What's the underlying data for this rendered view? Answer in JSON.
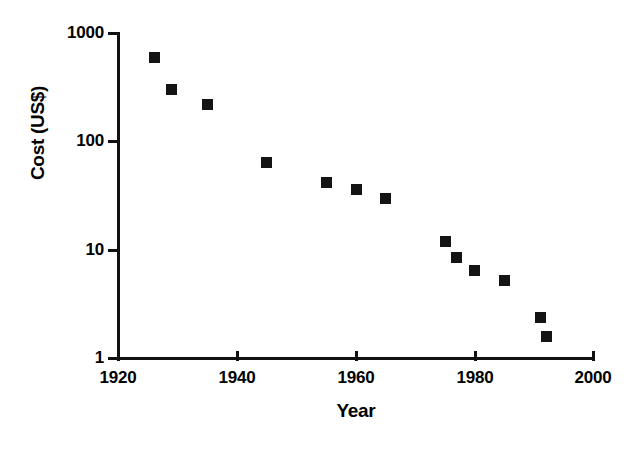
{
  "chart_data": {
    "type": "scatter",
    "title": "",
    "xlabel": "Year",
    "ylabel": "Cost (US$)",
    "xlim": [
      1920,
      2000
    ],
    "ylim": [
      1,
      1000
    ],
    "yscale": "log",
    "xscale": "linear",
    "grid": false,
    "legend": null,
    "xticks": [
      1920,
      1940,
      1960,
      1980,
      2000
    ],
    "xtick_labels": [
      "1920",
      "1940",
      "1960",
      "1980",
      "2000"
    ],
    "yticks": [
      1,
      10,
      100,
      1000
    ],
    "ytick_labels": [
      "1",
      "10",
      "100",
      "1000"
    ],
    "marker": "square",
    "marker_color": "#141414",
    "series": [
      {
        "name": "Cost",
        "x": [
          1926,
          1929,
          1935,
          1945,
          1955,
          1960,
          1965,
          1975,
          1977,
          1980,
          1985,
          1991,
          1992
        ],
        "y": [
          600,
          305,
          220,
          65,
          42,
          36,
          30,
          12,
          8.6,
          6.5,
          5.2,
          2.4,
          1.6
        ]
      }
    ],
    "points": [
      {
        "year": 1926,
        "cost": 600
      },
      {
        "year": 1929,
        "cost": 305
      },
      {
        "year": 1935,
        "cost": 220
      },
      {
        "year": 1945,
        "cost": 65
      },
      {
        "year": 1955,
        "cost": 42
      },
      {
        "year": 1960,
        "cost": 36
      },
      {
        "year": 1965,
        "cost": 30
      },
      {
        "year": 1975,
        "cost": 12
      },
      {
        "year": 1977,
        "cost": 8.6
      },
      {
        "year": 1980,
        "cost": 6.5
      },
      {
        "year": 1985,
        "cost": 5.2
      },
      {
        "year": 1991,
        "cost": 2.4
      },
      {
        "year": 1992,
        "cost": 1.6
      }
    ]
  },
  "axes": {
    "y": {
      "title": "Cost (US$)",
      "labels": [
        "1000",
        "100",
        "10",
        "1"
      ]
    },
    "x": {
      "title": "Year",
      "labels": [
        "1920",
        "1940",
        "1960",
        "1980",
        "2000"
      ]
    }
  }
}
